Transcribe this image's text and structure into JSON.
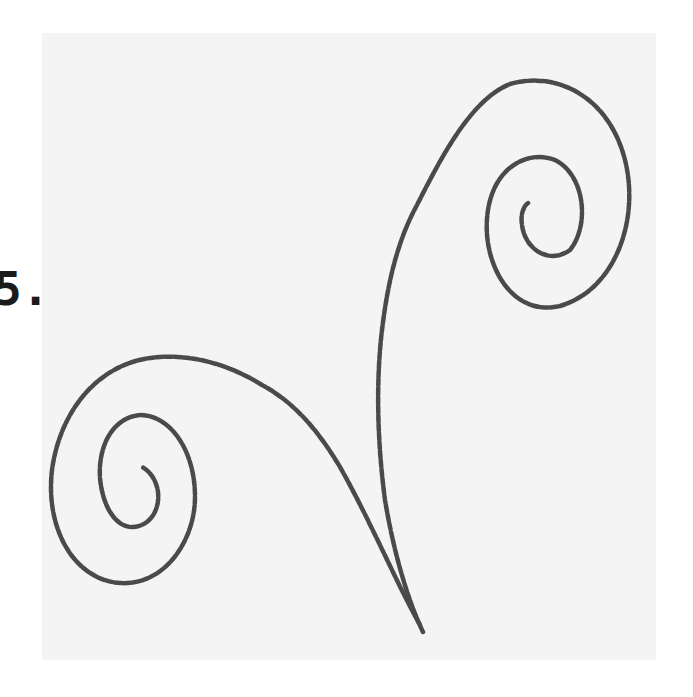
{
  "figure": {
    "label": "5.",
    "stroke_color": "#4a4a4a",
    "background_color": "#f4f4f4",
    "elements": [
      "left-spiral",
      "right-spiral"
    ]
  }
}
